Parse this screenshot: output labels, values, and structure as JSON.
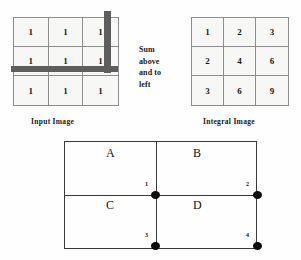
{
  "input_image": {
    "caption": "Input Image",
    "rows": [
      [
        "1",
        "1",
        "1"
      ],
      [
        "1",
        "1",
        "1"
      ],
      [
        "1",
        "1",
        "1"
      ]
    ],
    "sweep_bars": {
      "vertical_bar_name": "vertical-sweep-bar",
      "horizontal_bar_name": "horizontal-sweep-bar",
      "color": "#5e5e5e"
    }
  },
  "middle_caption": {
    "lines": [
      "Sum",
      "above",
      "and to",
      "left"
    ]
  },
  "integral_image": {
    "caption": "Integral Image",
    "rows": [
      [
        "1",
        "2",
        "3"
      ],
      [
        "2",
        "4",
        "6"
      ],
      [
        "3",
        "6",
        "9"
      ]
    ]
  },
  "quadrant_diagram": {
    "regions": [
      {
        "label": "A"
      },
      {
        "label": "B"
      },
      {
        "label": "C"
      },
      {
        "label": "D"
      }
    ],
    "corner_points": [
      {
        "number": "1"
      },
      {
        "number": "2"
      },
      {
        "number": "3"
      },
      {
        "number": "4"
      }
    ],
    "dot_color": "#0d0d0d",
    "line_color": "#3a3a3a"
  }
}
